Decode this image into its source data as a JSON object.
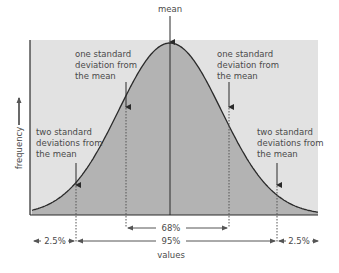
{
  "chart_data": {
    "type": "area",
    "title": "",
    "xlabel": "values",
    "ylabel": "frequency",
    "distribution": "normal",
    "annotations": [
      {
        "id": "mean",
        "text": "mean",
        "x_sigma": 0
      },
      {
        "id": "one_sd_left",
        "text": "one standard deviation from the mean",
        "x_sigma": -1
      },
      {
        "id": "one_sd_right",
        "text": "one standard deviation from the mean",
        "x_sigma": 1
      },
      {
        "id": "two_sd_left",
        "text": "two standard deviations from the mean",
        "x_sigma": -2
      },
      {
        "id": "two_sd_right",
        "text": "two standard deviations from the mean",
        "x_sigma": 2
      }
    ],
    "intervals": [
      {
        "label": "68%",
        "from_sigma": -1,
        "to_sigma": 1,
        "percent": 68
      },
      {
        "label": "95%",
        "from_sigma": -2,
        "to_sigma": 2,
        "percent": 95
      },
      {
        "label": "2.5%",
        "region": "left tail",
        "from_sigma": null,
        "to_sigma": -2,
        "percent": 2.5
      },
      {
        "label": "2.5%",
        "region": "right tail",
        "from_sigma": 2,
        "to_sigma": null,
        "percent": 2.5
      }
    ],
    "grid": false,
    "legend": null
  },
  "labels": {
    "mean": "mean",
    "one_sd_left": [
      "one standard",
      "deviation from",
      "the mean"
    ],
    "one_sd_right": [
      "one standard",
      "deviation from",
      "the mean"
    ],
    "two_sd_left": [
      "two standard",
      "deviations from",
      "the mean"
    ],
    "two_sd_right": [
      "two standard",
      "deviations from",
      "the mean"
    ],
    "pct_68": "68%",
    "pct_95": "95%",
    "pct_left_tail": "2.5%",
    "pct_right_tail": "2.5%",
    "xlabel": "values",
    "ylabel": "frequency"
  },
  "colors": {
    "plot_background": "#e2e2e2",
    "curve_fill": "#b3b3b3",
    "line": "#2a2a2a",
    "text": "#4a4a4a"
  }
}
